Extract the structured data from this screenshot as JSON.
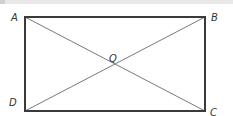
{
  "figure": {
    "shape": "rectangle",
    "vertices": [
      "A",
      "B",
      "C",
      "D"
    ],
    "diagonals": [
      "AC",
      "BD"
    ],
    "intersection_label": "Q",
    "labels": {
      "A": "A",
      "B": "B",
      "C": "C",
      "D": "D",
      "Q": "Q"
    },
    "colors": {
      "outline": "#3a3a3a",
      "diagonal": "#6a6a6a",
      "label": "#333333"
    }
  }
}
